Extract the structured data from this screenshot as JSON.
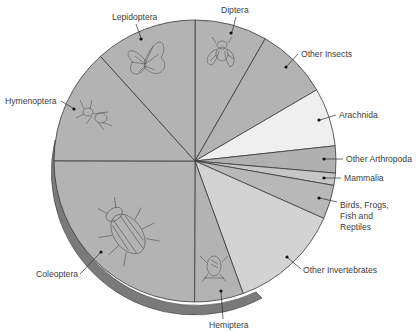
{
  "chart_data": {
    "type": "pie",
    "title": "",
    "start_angle_deg": 0,
    "direction": "clockwise",
    "slices": [
      {
        "label": "Diptera",
        "value": 8.3,
        "color": "#b3b3b3",
        "icon": "fly-icon"
      },
      {
        "label": "Other Insects",
        "value": 8.3,
        "color": "#b3b3b3"
      },
      {
        "label": "Arachnida",
        "value": 6.7,
        "color": "#efefef"
      },
      {
        "label": "Other Arthropoda",
        "value": 3.1,
        "color": "#b0b0b0"
      },
      {
        "label": "Mammalia",
        "value": 1.4,
        "color": "#c6c6c6"
      },
      {
        "label": "Birds, Frogs, Fish and Reptiles",
        "value": 3.9,
        "color": "#b8b8b8"
      },
      {
        "label": "Other Invertebrates",
        "value": 12.8,
        "color": "#d3d3d3"
      },
      {
        "label": "Hemiptera",
        "value": 5.6,
        "color": "#b3b3b3",
        "icon": "bug-icon"
      },
      {
        "label": "Coleoptera",
        "value": 25.0,
        "color": "#b3b3b3",
        "icon": "beetle-icon"
      },
      {
        "label": "Hymenoptera",
        "value": 13.3,
        "color": "#b3b3b3",
        "icon": "ant-icon"
      },
      {
        "label": "Lepidoptera",
        "value": 11.7,
        "color": "#b3b3b3",
        "icon": "butterfly-icon"
      }
    ],
    "legend": "none (labels with leader lines)",
    "rim_shadow_color": "#7a7a7a"
  },
  "labels": {
    "diptera": "Diptera",
    "other_insects": "Other Insects",
    "arachnida": "Arachnida",
    "other_arthropoda": "Other Arthropoda",
    "mammalia": "Mammalia",
    "birds_1": "Birds, Frogs,",
    "birds_2": "Fish and",
    "birds_3": "Reptiles",
    "other_invertebrates": "Other Invertebrates",
    "hemiptera": "Hemiptera",
    "coleoptera": "Coleoptera",
    "hymenoptera": "Hymenoptera",
    "lepidoptera": "Lepidoptera"
  }
}
